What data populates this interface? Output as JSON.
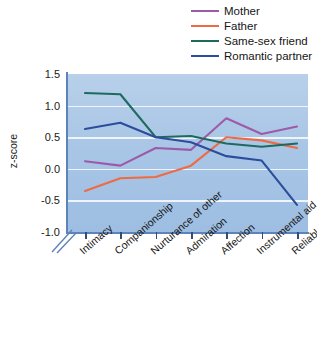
{
  "chart_data": {
    "type": "line",
    "title": "",
    "subtitle": "",
    "xlabel": "",
    "ylabel": "z-score",
    "ylim": [
      -1.0,
      1.5
    ],
    "yticks": [
      1.5,
      1.0,
      0.5,
      0.0,
      -0.5,
      -1.0
    ],
    "ytick_labels": [
      "1.5",
      "1.0",
      "0.5",
      "0.0",
      "-0.5",
      "-1.0"
    ],
    "grid": true,
    "legend_position": "top-right",
    "categories": [
      "Intimacy",
      "Companionship",
      "Nurturance of other",
      "Admiration",
      "Affection",
      "Instrumental aid",
      "Reliable alliance"
    ],
    "series": [
      {
        "name": "Mother",
        "color": "#9c5aa8",
        "values": [
          0.12,
          0.05,
          0.33,
          0.3,
          0.8,
          0.55,
          0.67
        ]
      },
      {
        "name": "Father",
        "color": "#ee6a43",
        "values": [
          -0.35,
          -0.15,
          -0.13,
          0.05,
          0.5,
          0.45,
          0.33
        ]
      },
      {
        "name": "Same-sex friend",
        "color": "#1d6b5e",
        "values": [
          1.2,
          1.18,
          0.5,
          0.52,
          0.4,
          0.35,
          0.4
        ]
      },
      {
        "name": "Romantic partner",
        "color": "#2b4d9c",
        "values": [
          0.63,
          0.73,
          0.5,
          0.42,
          0.2,
          0.13,
          -0.57
        ]
      }
    ]
  },
  "legend": {
    "items": [
      {
        "label": "Mother",
        "color": "#9c5aa8"
      },
      {
        "label": "Father",
        "color": "#ee6a43"
      },
      {
        "label": "Same-sex friend",
        "color": "#1d6b5e"
      },
      {
        "label": "Romantic partner",
        "color": "#2b4d9c"
      }
    ]
  },
  "axes": {
    "y_axis_title": "z-score",
    "plot_background": "#aec9e6"
  }
}
